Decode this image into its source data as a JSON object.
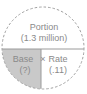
{
  "diagram": {
    "type": "percentage-circle",
    "top": {
      "title": "Portion",
      "value": "(1.3 million)"
    },
    "bottom_left": {
      "title": "Base",
      "value": "(?)",
      "highlighted": true
    },
    "operator": "×",
    "bottom_right": {
      "title": "Rate",
      "value": "(.11)"
    },
    "colors": {
      "outline": "#a0a0a0",
      "fill_highlight": "#c9c9c9",
      "divider": "#9a9a9a",
      "text": "#8a8a8a"
    }
  }
}
